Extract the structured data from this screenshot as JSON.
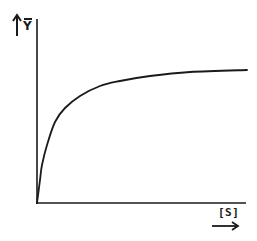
{
  "chart_data": {
    "type": "line",
    "title": "",
    "xlabel": "[S]",
    "ylabel": "Ȳ",
    "axes": {
      "x_arrow": true,
      "y_arrow": true,
      "ticks": false,
      "grid": false
    },
    "series": [
      {
        "name": "saturation",
        "points_px": [
          [
            37,
            203
          ],
          [
            40,
            180
          ],
          [
            42,
            165
          ],
          [
            47,
            145
          ],
          [
            55,
            122
          ],
          [
            65,
            108
          ],
          [
            80,
            96
          ],
          [
            100,
            86
          ],
          [
            120,
            81
          ],
          [
            150,
            76
          ],
          [
            190,
            72
          ],
          [
            247,
            70
          ]
        ]
      }
    ],
    "xlim": [
      0,
      1
    ],
    "ylim": [
      0,
      1
    ]
  },
  "labels": {
    "y_axis": "Y",
    "x_axis": "[S]"
  },
  "colors": {
    "ink": "#1a1a1a",
    "background": "#ffffff"
  }
}
